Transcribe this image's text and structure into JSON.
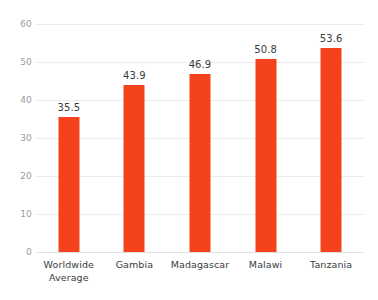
{
  "chart_data": {
    "type": "bar",
    "title": "",
    "subtitle": "",
    "xlabel": "",
    "ylabel": "",
    "categories": [
      "Worldwide Average",
      "Gambia",
      "Madagascar",
      "Malawi",
      "Tanzania"
    ],
    "category_lines": [
      [
        "Worldwide",
        "Average"
      ],
      [
        "Gambia"
      ],
      [
        "Madagascar"
      ],
      [
        "Malawi"
      ],
      [
        "Tanzania"
      ]
    ],
    "values": [
      35.5,
      43.9,
      46.9,
      50.8,
      53.6
    ],
    "value_labels": [
      "35.5",
      "43.9",
      "46.9",
      "50.8",
      "53.6"
    ],
    "ylim": [
      0,
      60
    ],
    "yticks": [
      0,
      10,
      20,
      30,
      40,
      50,
      60
    ],
    "ytick_labels": [
      "0",
      "10",
      "20",
      "30",
      "40",
      "50",
      "60"
    ],
    "grid": true,
    "grid_axis": "y",
    "legend": false,
    "legend_position": "none",
    "bar_color": "#f4431c",
    "grid_color": "#ececed",
    "axis_text_color": "#9a9a9c",
    "label_text_color": "#3b3b3d",
    "background_color": "#ffffff"
  }
}
